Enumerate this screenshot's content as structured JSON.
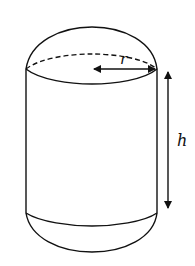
{
  "figure": {
    "labels": {
      "radius": "r",
      "height": "h"
    },
    "colors": {
      "stroke": "#111111",
      "background": "#ffffff"
    }
  }
}
